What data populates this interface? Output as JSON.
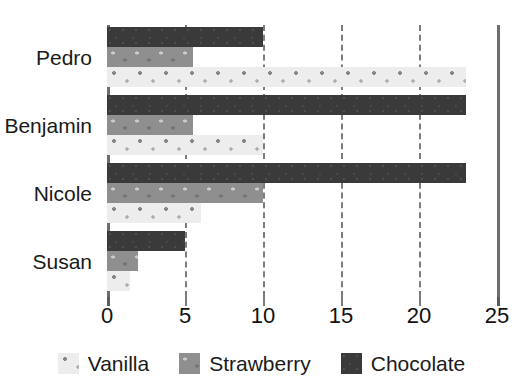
{
  "chart_data": {
    "type": "bar",
    "orientation": "horizontal",
    "title": "",
    "subtitle": "",
    "xlabel": "",
    "ylabel": "",
    "categories": [
      "Pedro",
      "Benjamin",
      "Nicole",
      "Susan"
    ],
    "series": [
      {
        "name": "Vanilla",
        "values": [
          23,
          10,
          6,
          1.5
        ],
        "color": "#ededed"
      },
      {
        "name": "Strawberry",
        "values": [
          5.5,
          5.5,
          10,
          2
        ],
        "color": "#8f8f8f"
      },
      {
        "name": "Chocolate",
        "values": [
          10,
          23,
          23,
          5
        ],
        "color": "#3a3a3a"
      }
    ],
    "bar_order_within_group_top_to_bottom": [
      "Chocolate",
      "Strawberry",
      "Vanilla"
    ],
    "xlim": [
      0,
      25
    ],
    "xticks": [
      0,
      5,
      10,
      15,
      20,
      25
    ],
    "xtick_labels": [
      "0",
      "5",
      "10",
      "15",
      "20",
      "25"
    ],
    "grid": true,
    "grid_style": "dashed-vertical",
    "legend_position": "bottom",
    "legend_entries": [
      "Vanilla",
      "Strawberry",
      "Chocolate"
    ]
  },
  "axis": {
    "tick_labels": [
      "0",
      "5",
      "10",
      "15",
      "20",
      "25"
    ],
    "category_labels": [
      "Pedro",
      "Benjamin",
      "Nicole",
      "Susan"
    ]
  },
  "legend": {
    "items": [
      {
        "label": "Vanilla",
        "swatch": "vanilla-swatch"
      },
      {
        "label": "Strawberry",
        "swatch": "strawberry-swatch"
      },
      {
        "label": "Chocolate",
        "swatch": "chocolate-swatch"
      }
    ]
  },
  "colors": {
    "vanilla": "#ededed",
    "strawberry": "#8f8f8f",
    "chocolate": "#3a3a3a",
    "axis": "#6e6e6e",
    "grid": "#7d7d7d",
    "text": "#1a1a1a",
    "background": "#ffffff"
  }
}
